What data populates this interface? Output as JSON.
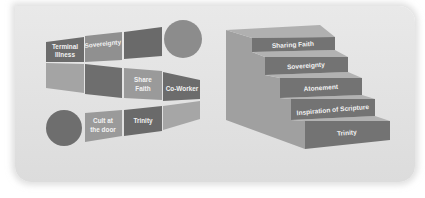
{
  "figure": {
    "colors": {
      "panel_bg": "#e3e3e3",
      "dark_cell": "#6e6e6e",
      "mid_cell": "#8f8f8f",
      "light_cell": "#a8a8a8",
      "circle": "#8a8a8a",
      "stair_front": "#727272",
      "stair_top": "#a6a6a6",
      "stair_side": "#999999",
      "label_text": "#f2f2f2"
    }
  },
  "serpentine": {
    "top_row": [
      {
        "line1": "Terminal",
        "line2": "Illness"
      },
      {
        "line1": "Sovereignty",
        "line2": ""
      },
      {
        "line1": "",
        "line2": ""
      }
    ],
    "middle_row": [
      {
        "line1": "",
        "line2": ""
      },
      {
        "line1": "",
        "line2": ""
      },
      {
        "line1": "Share",
        "line2": "Faith"
      },
      {
        "line1": "Co-Worker",
        "line2": ""
      }
    ],
    "bottom_row": [
      {
        "line1": "Cult at",
        "line2": "the door"
      },
      {
        "line1": "Trinity",
        "line2": ""
      },
      {
        "line1": "",
        "line2": ""
      }
    ]
  },
  "staircase": {
    "steps": [
      {
        "label": "Sharing Faith"
      },
      {
        "label": "Sovereignty"
      },
      {
        "label": "Atonement"
      },
      {
        "label": "Inspiration of Scripture"
      },
      {
        "label": "Trinity"
      }
    ]
  }
}
